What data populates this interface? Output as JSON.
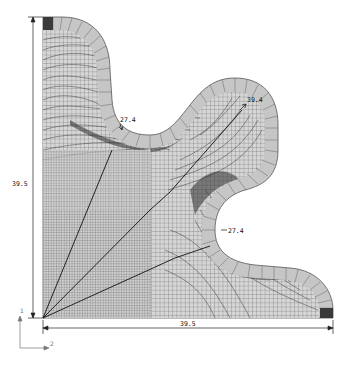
{
  "figure": {
    "type": "finite-element-mesh",
    "colors": {
      "background": "#ffffff",
      "mesh_fill": "#d4d4d4",
      "mesh_line": "#3a3a3a",
      "ring_fill": "#c9c9c9",
      "ring_line": "#555555",
      "dark_element": "#3c3c3c",
      "dimension_line": "#222222"
    }
  },
  "dimensions": {
    "height_label": "39.5",
    "width_label": "39.5",
    "radius_upper_valley": "27.4",
    "radius_lobe_peak": "39.4",
    "radius_lower_valley": "27.4"
  },
  "axes_triad": {
    "vertical_label": "1",
    "horizontal_label": "2"
  }
}
